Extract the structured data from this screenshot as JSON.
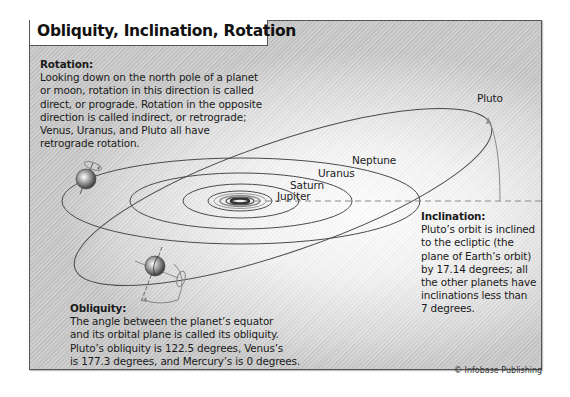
{
  "title": "Obliquity, Inclination, Rotation",
  "rotation": {
    "heading": "Rotation:",
    "lines": [
      "Looking down on the north pole of a planet",
      "or moon, rotation in this direction is called",
      "direct, or prograde. Rotation in the opposite",
      "direction is called indirect, or retrograde;",
      "Venus, Uranus, and Pluto all have",
      "retrograde rotation."
    ]
  },
  "obliquity": {
    "heading": "Obliquity:",
    "lines": [
      "The angle between the planet’s equator",
      "and its orbital plane is called its obliquity.",
      "Pluto’s obliquity is 122.5 degrees, Venus’s",
      "is 177.3 degrees, and Mercury’s is 0 degrees."
    ]
  },
  "inclination": {
    "heading": "Inclination:",
    "lines": [
      "Pluto’s orbit is inclined",
      "to the ecliptic (the",
      "plane of Earth’s orbit)",
      "by 17.14 degrees; all",
      "the other planets have",
      "inclinations less than",
      "7 degrees."
    ]
  },
  "orbit_labels": {
    "pluto": "Pluto",
    "neptune": "Neptune",
    "uranus": "Uranus",
    "saturn": "Saturn",
    "jupiter": "Jupiter"
  },
  "values": {
    "pluto_obliquity_deg": 122.5,
    "venus_obliquity_deg": 177.3,
    "mercury_obliquity_deg": 0,
    "pluto_inclination_deg": 17.14,
    "other_planets_max_inclination_deg": 7
  },
  "icons": {
    "rotation_planet": "planet-sphere-with-rotation-arrow",
    "obliquity_planet": "planet-sphere-with-tilted-axis",
    "inclination_arc": "arc-arrow"
  },
  "colors": {
    "orbit_line": "#4a4a4a",
    "ecliptic_dash": "#8a8a8a",
    "frame_border": "#555555",
    "text": "#1a1a1a"
  },
  "credit": "© Infobase Publishing"
}
